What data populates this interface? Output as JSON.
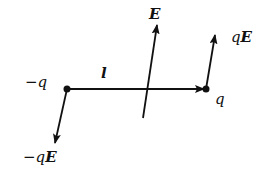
{
  "diagram": {
    "labels": {
      "neg_charge": "−q",
      "pos_charge": "q",
      "separation": "l",
      "field": "E",
      "force_pos_q": "q",
      "force_pos_E": "E",
      "force_neg_q": "−q",
      "force_neg_E": "E"
    },
    "nodes": [
      {
        "id": "neg-charge",
        "label": "−q",
        "x": 67,
        "y": 89
      },
      {
        "id": "pos-charge",
        "label": "q",
        "x": 206,
        "y": 89
      }
    ],
    "edges": [
      {
        "id": "dipole-vector-l",
        "from": "neg-charge",
        "to": "pos-charge",
        "label": "l"
      },
      {
        "id": "field-E",
        "label": "E",
        "from_xy": [
          143,
          118
        ],
        "to_xy": [
          157,
          25
        ]
      },
      {
        "id": "force-qE",
        "label": "qE",
        "from": "pos-charge",
        "to_xy": [
          215,
          35
        ]
      },
      {
        "id": "force-neg-qE",
        "label": "−qE",
        "from": "neg-charge",
        "to_xy": [
          55,
          143
        ]
      }
    ],
    "colors": {
      "ink": "#111111",
      "background": "#ffffff"
    }
  }
}
